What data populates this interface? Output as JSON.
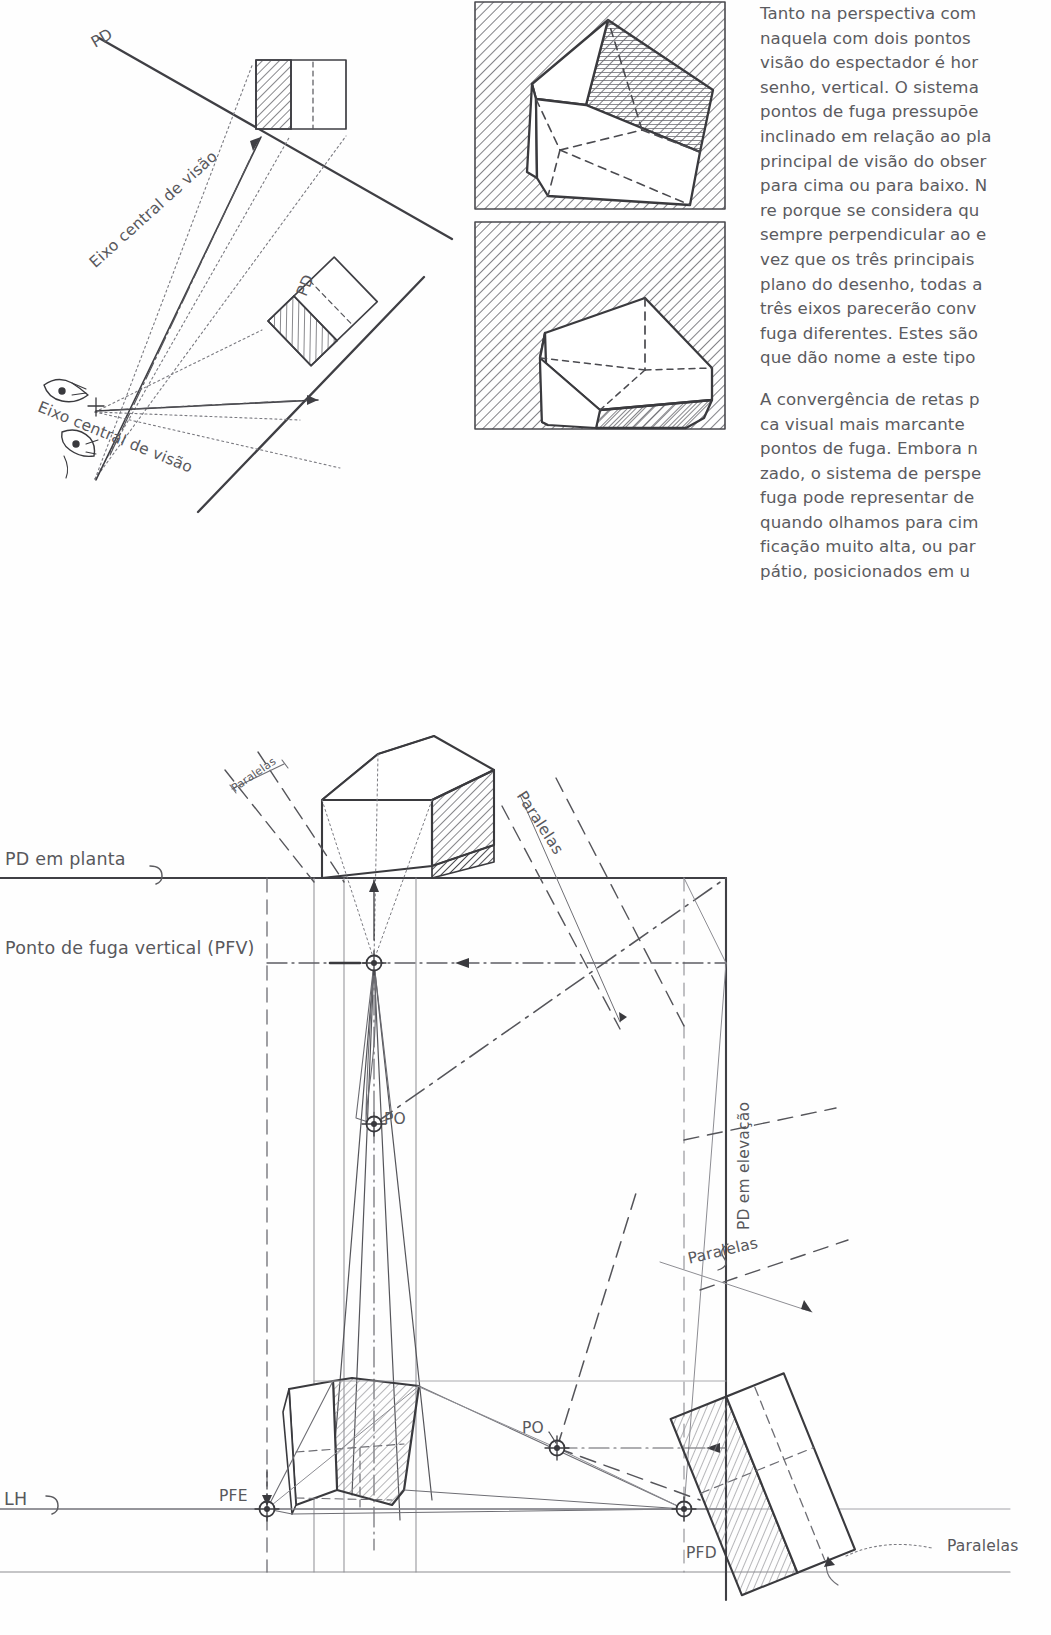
{
  "page": {
    "width": 1051,
    "height": 1635,
    "background": "#ffffff",
    "ink_color": "#58585c",
    "dark_ink": "#3a3a3e"
  },
  "text_column": {
    "paragraphs": [
      "Tanto na perspectiva com naquela com dois pontos visão do espectador é hor senho, vertical. O sistema pontos de fuga pressupõe inclinado em relação ao pla principal de visão do obser para cima ou para baixo. N re porque se considera qu sempre perpendicular ao e vez que os três principais plano do desenho, todas a três eixos parecerão conv fuga diferentes. Estes são que dão nome a este tipo",
      "A convergência de retas p ca visual mais marcante pontos de fuga. Embora n zado, o sistema de perspe fuga pode representar de quando olhamos para cim ficação muito alta, ou par pátio, posicionados em u"
    ],
    "paragraph_lines": [
      [
        "Tanto na perspectiva com",
        "naquela com dois pontos",
        "visão do espectador é hor",
        "senho, vertical. O sistema",
        "pontos de fuga pressupõe",
        "inclinado em relação ao pla",
        "principal de visão do obser",
        "para cima ou para baixo. N",
        "re porque se considera qu",
        "sempre perpendicular ao e",
        "vez que os três principais",
        "plano do desenho, todas a",
        "três eixos parecerão conv",
        "fuga diferentes. Estes são",
        "que dão nome a este tipo"
      ],
      [
        "A convergência de retas p",
        "ca visual mais marcante",
        "pontos de fuga. Embora n",
        "zado, o sistema de perspe",
        "fuga pode representar de",
        "quando olhamos para cim",
        "ficação muito alta, ou par",
        "pátio, posicionados em u"
      ]
    ]
  },
  "figure_top_left": {
    "name": "plan-diagram-two-viewpoints",
    "labels": [
      {
        "id": "pd-upper",
        "text": "PD",
        "x": 88,
        "y": 46,
        "rotate": -30
      },
      {
        "id": "eixo-upper",
        "text": "Eixo central de visão",
        "x": 85,
        "y": 262,
        "rotate": -42
      },
      {
        "id": "pd-lower",
        "text": "PD",
        "x": 290,
        "y": 296,
        "rotate": -68
      },
      {
        "id": "eixo-lower",
        "text": "Eixo central de visão",
        "x": 48,
        "y": 400,
        "rotate": 22
      }
    ]
  },
  "figure_cubes": {
    "name": "two-cube-panels",
    "panels": [
      {
        "id": "cube-top",
        "x": 475,
        "y": 2,
        "w": 250,
        "h": 207,
        "shaded_face": "top-right",
        "hatch": "diagonal"
      },
      {
        "id": "cube-bottom",
        "x": 475,
        "y": 222,
        "w": 250,
        "h": 207,
        "shaded_face": "front-right",
        "hatch": "diagonal"
      }
    ]
  },
  "figure_main": {
    "name": "three-point-perspective-construction",
    "labels": [
      {
        "id": "pd-em-planta",
        "text": "PD em planta",
        "x": 5,
        "y": 862,
        "size": "lg"
      },
      {
        "id": "pfv",
        "text": "Ponto de fuga vertical (PFV)",
        "x": 5,
        "y": 950,
        "size": "lg"
      },
      {
        "id": "paralelas-1",
        "text": "Paralelas",
        "x": 228,
        "y": 782,
        "size": "sm",
        "rotate": -35
      },
      {
        "id": "paralelas-2",
        "text": "Paralelas",
        "x": 520,
        "y": 790,
        "size": "md",
        "rotate": 57
      },
      {
        "id": "po-upper",
        "text": "PO",
        "x": 382,
        "y": 1114,
        "size": "md"
      },
      {
        "id": "pd-em-elevacao",
        "text": "PD em elevação",
        "x": 744,
        "y": 1095,
        "size": "md",
        "rotate": -90
      },
      {
        "id": "paralelas-3",
        "text": "Paralelas",
        "x": 682,
        "y": 1258,
        "size": "md",
        "rotate": -13
      },
      {
        "id": "po-lower",
        "text": "PO",
        "x": 524,
        "y": 1427,
        "size": "md"
      },
      {
        "id": "lh",
        "text": "LH",
        "x": 4,
        "y": 1500,
        "size": "lg"
      },
      {
        "id": "pfe",
        "text": "PFE",
        "x": 219,
        "y": 1494,
        "size": "md"
      },
      {
        "id": "pfd",
        "text": "PFD",
        "x": 686,
        "y": 1551,
        "size": "md"
      },
      {
        "id": "paralelas-4",
        "text": "Paralelas",
        "x": 945,
        "y": 1545,
        "size": "md"
      }
    ],
    "vanishing_points": [
      {
        "id": "PFV",
        "x": 374,
        "y": 963
      },
      {
        "id": "PO-elev",
        "x": 374,
        "y": 1124
      },
      {
        "id": "PO-plan",
        "x": 557,
        "y": 1448
      },
      {
        "id": "PFE",
        "x": 267,
        "y": 1509
      },
      {
        "id": "PFD",
        "x": 684,
        "y": 1509
      }
    ],
    "reference_lines": {
      "pd_em_planta_y": 878,
      "pfv_y": 963,
      "lh_y": 1509,
      "baseline_y": 1572,
      "pd_em_elevacao_x": 726
    }
  }
}
